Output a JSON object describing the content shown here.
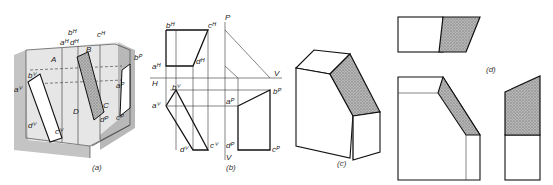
{
  "figure": {
    "panels": [
      {
        "id": "a",
        "caption": "(a)",
        "description": "Pictorial view of oblique plane ABCD inside three projection planes",
        "labels": [
          "bH",
          "cH",
          "aH",
          "dH",
          "B",
          "A",
          "C",
          "D",
          "bV",
          "aV",
          "dV",
          "cV",
          "bP",
          "aP",
          "cP",
          "dP"
        ]
      },
      {
        "id": "b",
        "caption": "(b)",
        "description": "Orthographic projections with H, V, P reference lines",
        "reference_lines": [
          "P",
          "H",
          "V",
          "V"
        ],
        "labels": [
          "bH",
          "cH",
          "aH",
          "dH",
          "bV",
          "aV",
          "dV",
          "cV",
          "aP",
          "bP",
          "dP",
          "cP"
        ]
      },
      {
        "id": "c",
        "caption": "(c)",
        "description": "Isometric block with shaded inclined surface"
      },
      {
        "id": "d",
        "caption": "(d)",
        "description": "Multi-view drawing of block with shaded inclined surface"
      }
    ],
    "colors": {
      "line": "#111111",
      "shade": "#9a9a9a",
      "background_gray": "#c8c8c8"
    }
  }
}
